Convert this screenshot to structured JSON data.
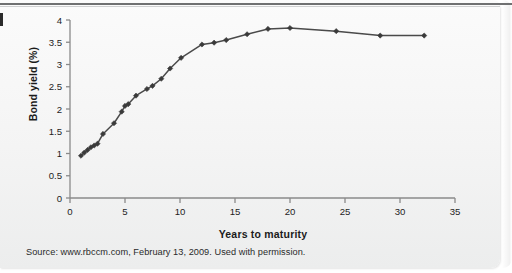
{
  "figure": {
    "source_note": "Source: www.rbccm.com, February 13, 2009. Used with permission.",
    "edge_mark": ""
  },
  "colors": {
    "line": "#4a4a4a",
    "marker": "#3a3a3a",
    "axis": "#8a8a8a",
    "text": "#1b1b1b",
    "background": "#f5f5f5"
  },
  "chart_data": {
    "type": "line",
    "title": "",
    "xlabel": "Years to maturity",
    "ylabel": "Bond yield (%)",
    "xlim": [
      0,
      35
    ],
    "ylim": [
      0,
      4
    ],
    "xticks": [
      0,
      5,
      10,
      15,
      20,
      25,
      30,
      35
    ],
    "yticks": [
      0,
      0.5,
      1,
      1.5,
      2,
      2.5,
      3,
      3.5,
      4
    ],
    "xtick_labels": [
      "0",
      "5",
      "10",
      "15",
      "20",
      "25",
      "30",
      "35"
    ],
    "ytick_labels": [
      "0",
      "0.5",
      "1",
      "1.5",
      "2",
      "2.5",
      "3",
      "3.5",
      "4"
    ],
    "grid": false,
    "legend": null,
    "marker": "diamond",
    "series": [
      {
        "name": "Bond yield",
        "x": [
          1.0,
          1.3,
          1.6,
          1.9,
          2.2,
          2.5,
          3.0,
          4.0,
          4.7,
          5.0,
          5.3,
          6.0,
          7.0,
          7.5,
          8.3,
          9.1,
          10.1,
          12.0,
          13.1,
          14.2,
          16.1,
          18.0,
          20.0,
          24.2,
          28.2,
          32.2
        ],
        "y": [
          0.95,
          1.02,
          1.08,
          1.14,
          1.18,
          1.22,
          1.44,
          1.68,
          1.94,
          2.07,
          2.11,
          2.3,
          2.45,
          2.52,
          2.68,
          2.91,
          3.15,
          3.45,
          3.49,
          3.55,
          3.68,
          3.8,
          3.82,
          3.75,
          3.65,
          3.65
        ]
      }
    ]
  }
}
